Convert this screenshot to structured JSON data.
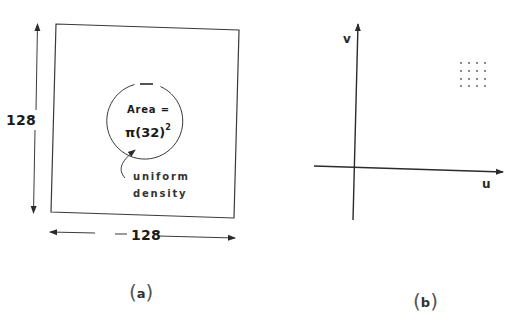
{
  "panel_a": {
    "caption_letter": "a",
    "box_height_label": "128",
    "box_width_label": "128",
    "circle_label_line1": "Area =",
    "circle_label_line2_base": "π(32)",
    "circle_label_line2_exp": "2",
    "annotation_line1": "uniform",
    "annotation_line2": "density"
  },
  "panel_b": {
    "caption_letter": "b",
    "x_axis_label": "u",
    "y_axis_label": "v",
    "dot_grid": {
      "rows": 4,
      "cols": 4
    }
  },
  "colors": {
    "line": "#2b2b2b",
    "background": "#ffffff"
  }
}
